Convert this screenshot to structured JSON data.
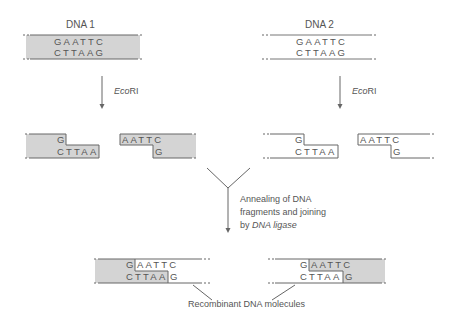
{
  "diagram": {
    "title_left": "DNA 1",
    "title_right": "DNA 2",
    "enzyme_left": {
      "italic": "Eco",
      "plain": "RI"
    },
    "enzyme_right": {
      "italic": "Eco",
      "plain": "RI"
    },
    "dna1": {
      "top": "GAATTC",
      "bottom": "CTTAAG",
      "fill": "shaded"
    },
    "dna2": {
      "top": "GAATTC",
      "bottom": "CTTAAG",
      "fill": "none"
    },
    "fragments_dna1": {
      "left": {
        "top": "G",
        "bottom": "CTTAA"
      },
      "right": {
        "top": "AATTC",
        "bottom": "G"
      }
    },
    "fragments_dna2": {
      "left": {
        "top": "G",
        "bottom": "CTTAA"
      },
      "right": {
        "top": "AATTC",
        "bottom": "G"
      }
    },
    "annealing_label": {
      "line1": "Annealing of DNA",
      "line2": "fragments and joining",
      "line3_prefix": "by ",
      "line3_italic": "DNA ligase"
    },
    "recombinant_left": {
      "top_a": "G",
      "top_b": "AATTC",
      "bottom_a": "CTTAA",
      "bottom_b": "G"
    },
    "recombinant_right": {
      "top_a": "G",
      "top_b": "AATTC",
      "bottom_a": "CTTAA",
      "bottom_b": "G"
    },
    "result_label": "Recombinant DNA molecules",
    "colors": {
      "shade": "#d4d4d4",
      "line": "#666666",
      "text": "#555555"
    }
  }
}
